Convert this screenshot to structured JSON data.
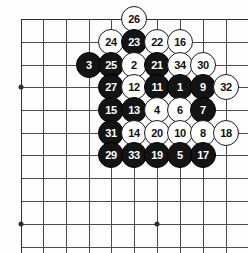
{
  "diagram": {
    "type": "go-board-move-sequence",
    "board": {
      "cols": 10,
      "rows": 11,
      "col_x": [
        21,
        43,
        66,
        89,
        111,
        134,
        157,
        180,
        203,
        226
      ],
      "row_y": [
        19,
        42,
        65,
        87,
        110,
        133,
        155,
        178,
        201,
        224,
        247
      ],
      "line_color": "#4a4a4a",
      "edge_color": "#2e2e2e",
      "background": "#fdfdfd",
      "star_points": [
        {
          "col": 0,
          "row": 3
        },
        {
          "col": 0,
          "row": 9
        },
        {
          "col": 6,
          "row": 9
        }
      ]
    },
    "stone_colors": {
      "black_fill": "#141414",
      "black_text": "#ffffff",
      "white_fill": "#ffffff",
      "white_text": "#111111",
      "white_border": "#1a1a1a"
    },
    "stones": [
      {
        "label": "26",
        "color": "white",
        "col": 5,
        "row": 0
      },
      {
        "label": "24",
        "color": "white",
        "col": 4,
        "row": 1
      },
      {
        "label": "23",
        "color": "black",
        "col": 5,
        "row": 1
      },
      {
        "label": "22",
        "color": "white",
        "col": 6,
        "row": 1
      },
      {
        "label": "16",
        "color": "white",
        "col": 7,
        "row": 1
      },
      {
        "label": "3",
        "color": "black",
        "col": 3,
        "row": 2
      },
      {
        "label": "25",
        "color": "black",
        "col": 4,
        "row": 2
      },
      {
        "label": "2",
        "color": "white",
        "col": 5,
        "row": 2
      },
      {
        "label": "21",
        "color": "black",
        "col": 6,
        "row": 2
      },
      {
        "label": "34",
        "color": "white",
        "col": 7,
        "row": 2
      },
      {
        "label": "30",
        "color": "white",
        "col": 8,
        "row": 2
      },
      {
        "label": "27",
        "color": "black",
        "col": 4,
        "row": 3
      },
      {
        "label": "12",
        "color": "white",
        "col": 5,
        "row": 3
      },
      {
        "label": "11",
        "color": "black",
        "col": 6,
        "row": 3
      },
      {
        "label": "1",
        "color": "black",
        "col": 7,
        "row": 3
      },
      {
        "label": "9",
        "color": "black",
        "col": 8,
        "row": 3
      },
      {
        "label": "32",
        "color": "white",
        "col": 9,
        "row": 3
      },
      {
        "label": "15",
        "color": "black",
        "col": 4,
        "row": 4
      },
      {
        "label": "13",
        "color": "black",
        "col": 5,
        "row": 4
      },
      {
        "label": "4",
        "color": "white",
        "col": 6,
        "row": 4
      },
      {
        "label": "6",
        "color": "white",
        "col": 7,
        "row": 4
      },
      {
        "label": "7",
        "color": "black",
        "col": 8,
        "row": 4
      },
      {
        "label": "31",
        "color": "black",
        "col": 4,
        "row": 5
      },
      {
        "label": "14",
        "color": "white",
        "col": 5,
        "row": 5
      },
      {
        "label": "20",
        "color": "white",
        "col": 6,
        "row": 5
      },
      {
        "label": "10",
        "color": "white",
        "col": 7,
        "row": 5
      },
      {
        "label": "8",
        "color": "white",
        "col": 8,
        "row": 5
      },
      {
        "label": "18",
        "color": "white",
        "col": 9,
        "row": 5
      },
      {
        "label": "29",
        "color": "black",
        "col": 4,
        "row": 6
      },
      {
        "label": "33",
        "color": "black",
        "col": 5,
        "row": 6
      },
      {
        "label": "19",
        "color": "black",
        "col": 6,
        "row": 6
      },
      {
        "label": "5",
        "color": "black",
        "col": 7,
        "row": 6
      },
      {
        "label": "17",
        "color": "black",
        "col": 8,
        "row": 6
      }
    ]
  }
}
